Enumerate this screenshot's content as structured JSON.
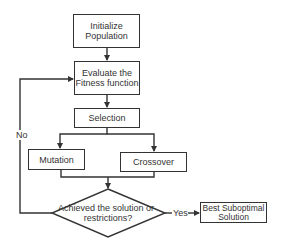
{
  "nodes": {
    "initialize": {
      "line1": "Initialize",
      "line2": "Population"
    },
    "evaluate": {
      "line1": "Evaluate the",
      "line2": "Fitness function"
    },
    "selection": {
      "label": "Selection"
    },
    "mutation": {
      "label": "Mutation"
    },
    "crossover": {
      "label": "Crossover"
    },
    "decision": {
      "line1": "Achieved the solution or",
      "line2": "restrictions?"
    },
    "result": {
      "line1": "Best Suboptimal",
      "line2": "Solution"
    }
  },
  "edges": {
    "no_label": "No",
    "yes_label": "Yes"
  },
  "colors": {
    "stroke": "#333333",
    "background": "#ffffff"
  }
}
